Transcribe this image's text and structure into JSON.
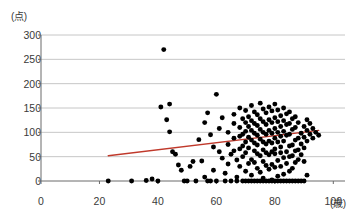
{
  "chart_data": {
    "type": "scatter",
    "title": "",
    "subtitle": "",
    "xlabel": "(歳)",
    "ylabel": "(点)",
    "xlim": [
      0,
      104
    ],
    "ylim": [
      0,
      300
    ],
    "grid": true,
    "grid_axis": "y",
    "legend": false,
    "legend_position": "none",
    "x_ticks": [
      0,
      20,
      40,
      60,
      80,
      100
    ],
    "y_ticks": [
      0,
      50,
      100,
      150,
      200,
      250,
      300
    ],
    "x_tick_labels": [
      "0",
      "20",
      "40",
      "60",
      "80",
      "100"
    ],
    "y_tick_labels": [
      "0",
      "50",
      "100",
      "150",
      "200",
      "250",
      "300"
    ],
    "marker": {
      "shape": "circle",
      "color": "#000000",
      "size": 3.1
    },
    "series": [
      {
        "name": "observations",
        "type": "scatter",
        "color": "#000000",
        "points": [
          [
            23,
            0
          ],
          [
            31,
            0
          ],
          [
            36,
            1
          ],
          [
            38,
            4
          ],
          [
            40,
            0
          ],
          [
            42,
            270
          ],
          [
            41,
            152
          ],
          [
            44,
            158
          ],
          [
            43,
            126
          ],
          [
            44,
            101
          ],
          [
            45,
            60
          ],
          [
            46,
            55
          ],
          [
            47,
            33
          ],
          [
            48,
            22
          ],
          [
            49,
            0
          ],
          [
            50,
            0
          ],
          [
            51,
            30
          ],
          [
            52,
            40
          ],
          [
            53,
            0
          ],
          [
            54,
            85
          ],
          [
            55,
            41
          ],
          [
            56,
            8
          ],
          [
            57,
            0
          ],
          [
            58,
            0
          ],
          [
            56,
            120
          ],
          [
            57,
            140
          ],
          [
            58,
            95
          ],
          [
            59,
            70
          ],
          [
            59,
            22
          ],
          [
            60,
            0
          ],
          [
            60,
            178
          ],
          [
            61,
            60
          ],
          [
            61,
            108
          ],
          [
            62,
            130
          ],
          [
            62,
            47
          ],
          [
            63,
            16
          ],
          [
            63,
            0
          ],
          [
            64,
            100
          ],
          [
            64,
            75
          ],
          [
            64,
            35
          ],
          [
            65,
            0
          ],
          [
            65,
            55
          ],
          [
            66,
            137
          ],
          [
            66,
            118
          ],
          [
            66,
            88
          ],
          [
            66,
            62
          ],
          [
            67,
            43
          ],
          [
            67,
            8
          ],
          [
            67,
            0
          ],
          [
            68,
            150
          ],
          [
            68,
            110
          ],
          [
            68,
            92
          ],
          [
            68,
            66
          ],
          [
            68,
            30
          ],
          [
            69,
            0
          ],
          [
            69,
            128
          ],
          [
            69,
            96
          ],
          [
            69,
            72
          ],
          [
            69,
            50
          ],
          [
            70,
            20
          ],
          [
            70,
            0
          ],
          [
            70,
            145
          ],
          [
            70,
            120
          ],
          [
            70,
            102
          ],
          [
            70,
            80
          ],
          [
            70,
            58
          ],
          [
            71,
            36
          ],
          [
            71,
            0
          ],
          [
            71,
            132
          ],
          [
            71,
            112
          ],
          [
            71,
            90
          ],
          [
            71,
            68
          ],
          [
            72,
            44
          ],
          [
            72,
            12
          ],
          [
            72,
            0
          ],
          [
            72,
            155
          ],
          [
            72,
            124
          ],
          [
            72,
            104
          ],
          [
            72,
            84
          ],
          [
            73,
            62
          ],
          [
            73,
            38
          ],
          [
            73,
            0
          ],
          [
            73,
            142
          ],
          [
            73,
            118
          ],
          [
            73,
            98
          ],
          [
            73,
            78
          ],
          [
            74,
            56
          ],
          [
            74,
            26
          ],
          [
            74,
            0
          ],
          [
            74,
            136
          ],
          [
            74,
            114
          ],
          [
            74,
            94
          ],
          [
            74,
            74
          ],
          [
            75,
            52
          ],
          [
            75,
            18
          ],
          [
            75,
            0
          ],
          [
            75,
            160
          ],
          [
            75,
            128
          ],
          [
            75,
            106
          ],
          [
            75,
            86
          ],
          [
            76,
            64
          ],
          [
            76,
            40
          ],
          [
            76,
            6
          ],
          [
            76,
            0
          ],
          [
            76,
            148
          ],
          [
            76,
            122
          ],
          [
            76,
            100
          ],
          [
            76,
            80
          ],
          [
            77,
            58
          ],
          [
            77,
            32
          ],
          [
            77,
            0
          ],
          [
            77,
            140
          ],
          [
            77,
            116
          ],
          [
            77,
            96
          ],
          [
            77,
            76
          ],
          [
            78,
            54
          ],
          [
            78,
            24
          ],
          [
            78,
            0
          ],
          [
            78,
            152
          ],
          [
            78,
            126
          ],
          [
            78,
            104
          ],
          [
            78,
            82
          ],
          [
            79,
            60
          ],
          [
            79,
            34
          ],
          [
            79,
            2
          ],
          [
            79,
            0
          ],
          [
            79,
            144
          ],
          [
            79,
            120
          ],
          [
            79,
            98
          ],
          [
            79,
            78
          ],
          [
            80,
            56
          ],
          [
            80,
            28
          ],
          [
            80,
            0
          ],
          [
            80,
            158
          ],
          [
            80,
            130
          ],
          [
            80,
            108
          ],
          [
            80,
            88
          ],
          [
            80,
            66
          ],
          [
            81,
            42
          ],
          [
            81,
            10
          ],
          [
            81,
            0
          ],
          [
            81,
            146
          ],
          [
            81,
            122
          ],
          [
            81,
            100
          ],
          [
            81,
            80
          ],
          [
            82,
            58
          ],
          [
            82,
            30
          ],
          [
            82,
            0
          ],
          [
            82,
            134
          ],
          [
            82,
            112
          ],
          [
            82,
            92
          ],
          [
            82,
            70
          ],
          [
            83,
            48
          ],
          [
            83,
            14
          ],
          [
            83,
            0
          ],
          [
            83,
            150
          ],
          [
            83,
            124
          ],
          [
            83,
            102
          ],
          [
            83,
            82
          ],
          [
            84,
            60
          ],
          [
            84,
            36
          ],
          [
            84,
            0
          ],
          [
            84,
            138
          ],
          [
            84,
            116
          ],
          [
            84,
            94
          ],
          [
            85,
            72
          ],
          [
            85,
            50
          ],
          [
            85,
            20
          ],
          [
            85,
            0
          ],
          [
            85,
            142
          ],
          [
            85,
            118
          ],
          [
            85,
            96
          ],
          [
            86,
            74
          ],
          [
            86,
            52
          ],
          [
            86,
            26
          ],
          [
            86,
            0
          ],
          [
            86,
            128
          ],
          [
            86,
            106
          ],
          [
            87,
            84
          ],
          [
            87,
            62
          ],
          [
            87,
            38
          ],
          [
            87,
            0
          ],
          [
            87,
            132
          ],
          [
            87,
            110
          ],
          [
            88,
            88
          ],
          [
            88,
            64
          ],
          [
            88,
            44
          ],
          [
            88,
            0
          ],
          [
            88,
            120
          ],
          [
            89,
            98
          ],
          [
            89,
            76
          ],
          [
            89,
            54
          ],
          [
            89,
            0
          ],
          [
            90,
            112
          ],
          [
            90,
            90
          ],
          [
            90,
            68
          ],
          [
            90,
            40
          ],
          [
            90,
            0
          ],
          [
            91,
            126
          ],
          [
            91,
            104
          ],
          [
            91,
            82
          ],
          [
            91,
            12
          ],
          [
            92,
            118
          ],
          [
            92,
            96
          ],
          [
            93,
            108
          ],
          [
            93,
            88
          ],
          [
            94,
            100
          ],
          [
            95,
            94
          ]
        ]
      }
    ],
    "trendline": {
      "name": "regression-line",
      "type": "line",
      "color": "#c0392b",
      "width": 1.4,
      "x_start": 23,
      "y_start": 52,
      "x_end": 95,
      "y_end": 104
    }
  }
}
